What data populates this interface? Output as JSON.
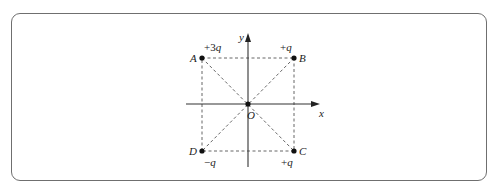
{
  "figure": {
    "axes": {
      "x_label": "x",
      "y_label": "y",
      "origin_label": "O"
    },
    "points": [
      {
        "id": "A",
        "label": "A",
        "charge": "+3q",
        "charge_sign": "+3",
        "charge_var": "q",
        "x": 202,
        "y": 58
      },
      {
        "id": "B",
        "label": "B",
        "charge": "+q",
        "charge_sign": "+",
        "charge_var": "q",
        "x": 294,
        "y": 58
      },
      {
        "id": "C",
        "label": "C",
        "charge": "+q",
        "charge_sign": "+",
        "charge_var": "q",
        "x": 294,
        "y": 151
      },
      {
        "id": "D",
        "label": "D",
        "charge": "−q",
        "charge_sign": "−",
        "charge_var": "q",
        "x": 202,
        "y": 151
      }
    ],
    "colors": {
      "line": "#333333",
      "dash": "#555555",
      "border": "#6f6f6f"
    }
  }
}
